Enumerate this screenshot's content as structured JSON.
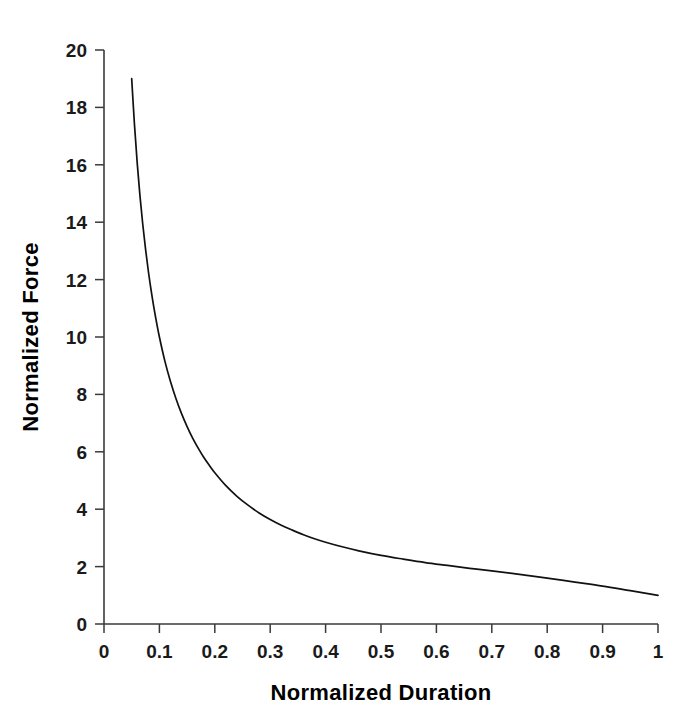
{
  "figure": {
    "background_color": "#ffffff",
    "foreground_color": "#000000"
  },
  "chart_data": {
    "type": "line",
    "title": "",
    "subtitle": "",
    "xlabel": "Normalized Duration",
    "ylabel": "Normalized Force",
    "xlim": [
      0,
      1
    ],
    "ylim": [
      0,
      20
    ],
    "grid": false,
    "legend": null,
    "legend_position": "none",
    "annotations": [],
    "line_color": "#111111",
    "line_width": 1.7,
    "xticks": [
      0,
      0.1,
      0.2,
      0.3,
      0.4,
      0.5,
      0.6,
      0.7,
      0.8,
      0.9,
      1
    ],
    "xticklabels": [
      "0",
      "0.1",
      "0.2",
      "0.3",
      "0.4",
      "0.5",
      "0.6",
      "0.7",
      "0.8",
      "0.9",
      "1"
    ],
    "yticks": [
      0,
      2,
      4,
      6,
      8,
      10,
      12,
      14,
      16,
      18,
      20
    ],
    "yticklabels": [
      "0",
      "2",
      "4",
      "6",
      "8",
      "10",
      "12",
      "14",
      "16",
      "18",
      "20"
    ],
    "series": [
      {
        "name": "normalized force vs duration",
        "x": [
          0.05,
          0.055,
          0.06,
          0.065,
          0.07,
          0.075,
          0.08,
          0.085,
          0.09,
          0.095,
          0.1,
          0.11,
          0.12,
          0.13,
          0.14,
          0.15,
          0.16,
          0.17,
          0.18,
          0.19,
          0.2,
          0.22,
          0.24,
          0.26,
          0.28,
          0.3,
          0.32,
          0.34,
          0.36,
          0.38,
          0.4,
          0.43,
          0.46,
          0.5,
          0.54,
          0.58,
          0.62,
          0.66,
          0.7,
          0.75,
          0.8,
          0.85,
          0.9,
          0.95,
          1.0
        ],
        "y": [
          19.0,
          17.4,
          16.05,
          14.9,
          13.92,
          13.06,
          12.3,
          11.63,
          11.03,
          10.49,
          10.0,
          9.15,
          8.45,
          7.85,
          7.33,
          6.88,
          6.48,
          6.13,
          5.81,
          5.53,
          5.27,
          4.82,
          4.45,
          4.14,
          3.87,
          3.64,
          3.44,
          3.27,
          3.11,
          2.97,
          2.85,
          2.69,
          2.55,
          2.39,
          2.26,
          2.14,
          2.04,
          1.94,
          1.85,
          1.73,
          1.6,
          1.46,
          1.32,
          1.16,
          1.0
        ]
      }
    ]
  },
  "axes": {
    "x_axis_name": "x-axis",
    "y_axis_name": "y-axis"
  }
}
